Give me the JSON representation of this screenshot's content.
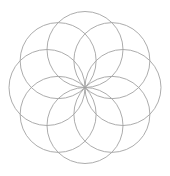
{
  "diagram": {
    "type": "rosette",
    "background": "#ffffff",
    "center": {
      "x": 85,
      "y": 87.5
    },
    "circle_count": 8,
    "circle_radius": 38,
    "orbit_radius": 38,
    "start_angle_deg": 0,
    "stroke_color": "#a3a3a3",
    "stroke_width": 0.9
  }
}
